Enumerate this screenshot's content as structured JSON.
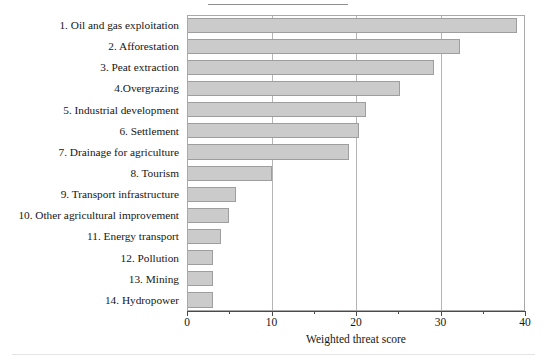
{
  "figure": {
    "background_color": "#ffffff",
    "bar_fill_color": "#cbcbcb",
    "bar_border_color": "#9e9e9e",
    "gridline_color": "#b5b5b5",
    "axis_color": "#4a4a4a"
  },
  "chart_data": {
    "type": "bar",
    "orientation": "horizontal",
    "title": "",
    "xlabel": "Weighted threat score",
    "ylabel": "",
    "xlim": [
      0,
      40
    ],
    "xticks": [
      0,
      10,
      20,
      30,
      40
    ],
    "xtick_labels": [
      "0",
      "10",
      "20",
      "30",
      "40"
    ],
    "minor_xticks": [
      5,
      15,
      25,
      35
    ],
    "grid": "vertical gridlines at 10, 20, 30",
    "legend": "none",
    "categories": [
      "1. Oil and gas exploitation",
      "2. Afforestation",
      "3. Peat extraction",
      "4.Overgrazing",
      "5. Industrial development",
      "6. Settlement",
      "7. Drainage for agriculture",
      "8. Tourism",
      "9. Transport infrastructure",
      "10. Other agricultural improvement",
      "11. Energy transport",
      "12. Pollution",
      "13. Mining",
      "14. Hydropower"
    ],
    "values": [
      39.0,
      32.3,
      29.2,
      25.2,
      21.2,
      20.3,
      19.2,
      10.0,
      5.8,
      5.0,
      4.0,
      3.1,
      3.1,
      3.1
    ]
  }
}
